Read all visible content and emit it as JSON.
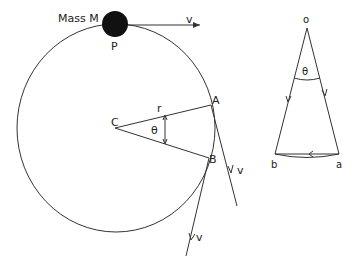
{
  "diagram": {
    "left_figure": {
      "mass_label": "Mass M",
      "point_p": "P",
      "center": "C",
      "point_a": "A",
      "point_b": "B",
      "radius_label": "r",
      "angle_label": "θ",
      "velocity_top": "v",
      "velocity_a": "v",
      "velocity_b": "v"
    },
    "right_figure": {
      "origin": "o",
      "angle_label": "θ",
      "point_a": "a",
      "point_b": "b"
    },
    "colors": {
      "line": "#333333",
      "mass": "#111111",
      "background": "#ffffff"
    }
  }
}
